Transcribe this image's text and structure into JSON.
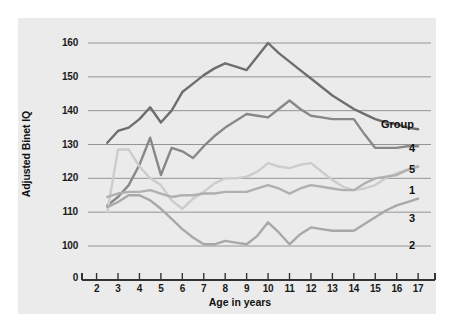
{
  "chart_data": {
    "type": "line",
    "title": "",
    "xlabel": "Age in years",
    "ylabel": "Adjusted Binet IQ",
    "x": [
      2,
      3,
      4,
      5,
      6,
      7,
      8,
      9,
      10,
      11,
      12,
      13,
      14,
      15,
      16,
      17
    ],
    "xlim": [
      1.6,
      17.6
    ],
    "ylim": [
      97,
      163
    ],
    "xtick_labels": [
      "2",
      "3",
      "4",
      "5",
      "6",
      "7",
      "8",
      "9",
      "10",
      "11",
      "12",
      "13",
      "14",
      "15",
      "16",
      "17"
    ],
    "ytick_labels": [
      "0",
      "100",
      "110",
      "120",
      "130",
      "140",
      "150",
      "160"
    ],
    "ytick_values": [
      100,
      110,
      120,
      130,
      140,
      150,
      160
    ],
    "y_axis_break_label": "0",
    "grid": "horizontal",
    "legend_title": "Group",
    "legend_position": "right-endpoints",
    "series": [
      {
        "name": "4",
        "label": "4",
        "color": "#6e6e6e",
        "x": [
          2.5,
          3,
          3.5,
          4,
          4.5,
          5,
          5.5,
          6,
          6.5,
          7,
          7.5,
          8,
          8.5,
          9,
          9.5,
          10,
          10.5,
          11,
          11.5,
          12,
          12.5,
          13,
          13.5,
          14,
          14.5,
          15,
          15.5,
          16,
          16.5,
          17
        ],
        "values": [
          130.5,
          134,
          135,
          137.5,
          141,
          136.5,
          140,
          145.5,
          148,
          150.5,
          152.5,
          154,
          153,
          152,
          156,
          160,
          157,
          154.5,
          152,
          149.5,
          147,
          144.5,
          142.5,
          140.5,
          139,
          137.5,
          136.5,
          136,
          135,
          134.5
        ]
      },
      {
        "name": "5",
        "label": "5",
        "color": "#888888",
        "x": [
          2.5,
          3,
          3.5,
          4,
          4.5,
          5,
          5.5,
          6,
          6.5,
          7,
          7.5,
          8,
          8.5,
          9,
          9.5,
          10,
          10.5,
          11,
          11.5,
          12,
          12.5,
          13,
          13.5,
          14,
          14.5,
          15,
          15.5,
          16,
          16.5,
          17
        ],
        "values": [
          112,
          114.5,
          118,
          124,
          132,
          121,
          129,
          128,
          126,
          129.5,
          132.5,
          135,
          137,
          139,
          138.5,
          138,
          140.5,
          143,
          140.5,
          138.5,
          138,
          137.5,
          137.5,
          137.5,
          133,
          129,
          129,
          129,
          129.5,
          129.5
        ]
      },
      {
        "name": "1",
        "label": "1",
        "color": "#cccccc",
        "x": [
          2.5,
          3,
          3.5,
          4,
          4.5,
          5,
          5.5,
          6,
          6.5,
          7,
          7.5,
          8,
          8.5,
          9,
          9.5,
          10,
          10.5,
          11,
          11.5,
          12,
          12.5,
          13,
          13.5,
          14,
          14.5,
          15,
          15.5,
          16,
          16.5,
          17
        ],
        "values": [
          110,
          128.5,
          128.5,
          123.5,
          120,
          118,
          113.5,
          111,
          114,
          116,
          118.5,
          120,
          120,
          120.5,
          122,
          124.5,
          123.5,
          123,
          124,
          124.5,
          122,
          119.5,
          117.5,
          116.5,
          117,
          118,
          120,
          121.5,
          122.5,
          123.5
        ]
      },
      {
        "name": "3",
        "label": "3",
        "color": "#b0b0b0",
        "x": [
          2.5,
          3,
          3.5,
          4,
          4.5,
          5,
          5.5,
          6,
          6.5,
          7,
          7.5,
          8,
          8.5,
          9,
          9.5,
          10,
          10.5,
          11,
          11.5,
          12,
          12.5,
          13,
          13.5,
          14,
          14.5,
          15,
          15.5,
          16,
          16.5,
          17
        ],
        "values": [
          114.5,
          115.5,
          116,
          116,
          116.5,
          115.5,
          114.5,
          115,
          115,
          115.5,
          115.5,
          116,
          116,
          116,
          117,
          118,
          117,
          115.5,
          117,
          118,
          117.5,
          117,
          116.5,
          116.5,
          118.5,
          120,
          120.5,
          121,
          122.5,
          123.5
        ]
      },
      {
        "name": "2",
        "label": "2",
        "color": "#a8a8a8",
        "x": [
          2.5,
          3,
          3.5,
          4,
          4.5,
          5,
          5.5,
          6,
          6.5,
          7,
          7.5,
          8,
          8.5,
          9,
          9.5,
          10,
          10.5,
          11,
          11.5,
          12,
          12.5,
          13,
          13.5,
          14,
          14.5,
          15,
          15.5,
          16,
          16.5,
          17
        ],
        "values": [
          111.5,
          113,
          115,
          115,
          113.5,
          111,
          108,
          105,
          102.5,
          100.5,
          100.5,
          101.5,
          101,
          100.5,
          103,
          107,
          104,
          100.5,
          103.5,
          105.5,
          105,
          104.5,
          104.5,
          104.5,
          106.5,
          108.5,
          110.5,
          112,
          113,
          114
        ]
      }
    ]
  },
  "legend": {
    "title": "Group",
    "items": [
      {
        "label": "4",
        "top": 142
      },
      {
        "label": "5",
        "top": 163
      },
      {
        "label": "1",
        "top": 184
      },
      {
        "label": "3",
        "top": 212
      },
      {
        "label": "2",
        "top": 239
      }
    ]
  },
  "colors": {
    "panel_background": "#ebebeb",
    "page_background": "#ffffff",
    "axis": "#333333",
    "grid": "#8a8a8a",
    "text": "#111111"
  }
}
